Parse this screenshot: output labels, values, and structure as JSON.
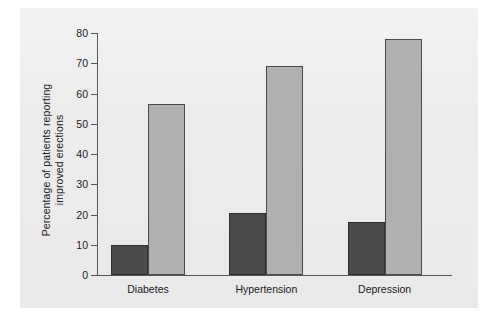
{
  "chart_data": {
    "type": "bar",
    "title": "",
    "subtitle": "",
    "xlabel": "",
    "ylabel_line1": "Percentage of patients reporting",
    "ylabel_line2": "improved erections",
    "categories": [
      "Diabetes",
      "Hypertension",
      "Depression"
    ],
    "series": [
      {
        "name": "dark-series",
        "color": "#4a4a4a",
        "values": [
          10,
          20.5,
          17.5
        ]
      },
      {
        "name": "light-series",
        "color": "#b0b0b0",
        "values": [
          56.5,
          69,
          78
        ]
      }
    ],
    "ylim": [
      0,
      80
    ],
    "ytick_labels": [
      "0",
      "10",
      "20",
      "30",
      "40",
      "50",
      "60",
      "70",
      "80"
    ],
    "ytick_values": [
      0,
      10,
      20,
      30,
      40,
      50,
      60,
      70,
      80
    ],
    "grid": false,
    "legend": "none",
    "annotations": []
  },
  "figure": {
    "background_color": "#ececec",
    "page_color": "#ffffff",
    "axis_color": "#575757"
  }
}
